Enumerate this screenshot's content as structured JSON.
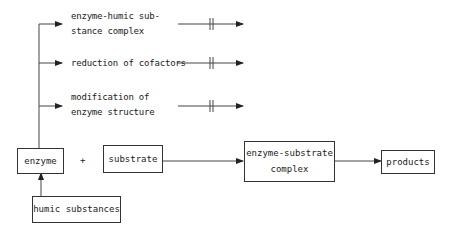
{
  "diagram": {
    "nodes": {
      "enzyme": "enzyme",
      "substrate": "substrate",
      "complex_line1": "enzyme-substrate",
      "complex_line2": "complex",
      "products": "products",
      "humic": "humic substances"
    },
    "plus": "+",
    "branches": [
      {
        "line1": "enzyme-humic sub-",
        "line2": "stance complex"
      },
      {
        "line1": "reduction of cofactors",
        "line2": ""
      },
      {
        "line1": "modification of",
        "line2": "enzyme structure"
      }
    ],
    "colors": {
      "line": "#333333",
      "text": "#1a1a1a",
      "background": "#ffffff"
    }
  }
}
